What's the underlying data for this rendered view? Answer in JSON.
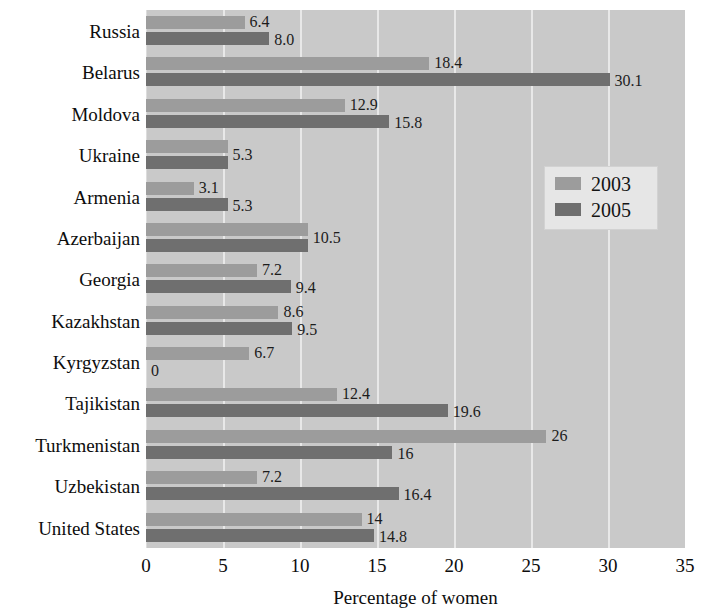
{
  "chart_data": {
    "type": "bar",
    "orientation": "horizontal",
    "title": "",
    "xlabel": "Percentage of women",
    "ylabel": "",
    "xlim": [
      0,
      35
    ],
    "xticks": [
      0,
      5,
      10,
      15,
      20,
      25,
      30,
      35
    ],
    "grid": true,
    "legend_position": "middle-right",
    "categories": [
      "Russia",
      "Belarus",
      "Moldova",
      "Ukraine",
      "Armenia",
      "Azerbaijan",
      "Georgia",
      "Kazakhstan",
      "Kyrgyzstan",
      "Tajikistan",
      "Turkmenistan",
      "Uzbekistan",
      "United States"
    ],
    "series": [
      {
        "name": "2003",
        "color": "#9c9c9c",
        "values": [
          6.4,
          18.4,
          12.9,
          5.3,
          3.1,
          10.5,
          7.2,
          8.6,
          6.7,
          12.4,
          26,
          7.2,
          14
        ],
        "labels": [
          "6.4",
          "18.4",
          "12.9",
          "5.3",
          "3.1",
          "10.5",
          "7.2",
          "8.6",
          "6.7",
          "12.4",
          "26",
          "7.2",
          "14"
        ]
      },
      {
        "name": "2005",
        "color": "#6f6f6f",
        "values": [
          8.0,
          30.1,
          15.8,
          5.3,
          5.3,
          10.5,
          9.4,
          9.5,
          0,
          19.6,
          16,
          16.4,
          14.8
        ],
        "labels": [
          "8.0",
          "30.1",
          "15.8",
          "5.3",
          "5.3",
          "10.5",
          "9.4",
          "9.5",
          "0",
          "19.6",
          "16",
          "16.4",
          "14.8"
        ]
      }
    ],
    "shared_labels": {
      "Ukraine": "5.3",
      "Azerbaijan": "10.5"
    }
  },
  "legend": {
    "items": [
      {
        "label": "2003",
        "color": "#9c9c9c"
      },
      {
        "label": "2005",
        "color": "#6f6f6f"
      }
    ]
  },
  "axis": {
    "x_title": "Percentage of women",
    "x_tick_labels": [
      "0",
      "5",
      "10",
      "15",
      "20",
      "25",
      "30",
      "35"
    ]
  },
  "colors": {
    "plot_background": "#c9c9c9",
    "gridline": "#e8e8e8",
    "series_2003": "#9c9c9c",
    "series_2005": "#6f6f6f",
    "text": "#0d0d0d",
    "legend_background": "#e6e6e6"
  }
}
